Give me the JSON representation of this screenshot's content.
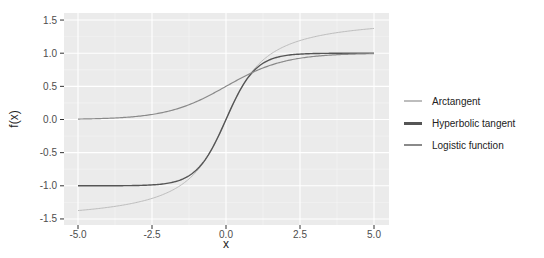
{
  "chart_data": {
    "type": "line",
    "title": "",
    "xlabel": "x",
    "ylabel": "f(x)",
    "xlim": [
      -5.5,
      5.5
    ],
    "ylim": [
      -1.5,
      1.5
    ],
    "x_ticks": [
      -5.0,
      -2.5,
      0.0,
      2.5,
      5.0
    ],
    "x_tick_labels": [
      "-5.0",
      "-2.5",
      "0.0",
      "2.5",
      "5.0"
    ],
    "y_ticks": [
      -1.5,
      -1.0,
      -0.5,
      0.0,
      0.5,
      1.0,
      1.5
    ],
    "y_tick_labels": [
      "-1.5",
      "-1.0",
      "-0.5",
      "0.0",
      "0.5",
      "1.0",
      "1.5"
    ],
    "grid": true,
    "legend_position": "right",
    "x": [
      -5,
      -4,
      -3,
      -2,
      -1,
      0,
      1,
      2,
      3,
      4,
      5
    ],
    "series": [
      {
        "name": "Arctangent",
        "color": "#bdbdbd",
        "function": "atan(x)",
        "values": [
          -1.37,
          -1.33,
          -1.25,
          -1.11,
          -0.79,
          0.0,
          0.79,
          1.11,
          1.25,
          1.33,
          1.37
        ]
      },
      {
        "name": "Hyperbolic tangent",
        "color": "#555555",
        "function": "tanh(x)",
        "values": [
          -1.0,
          -1.0,
          -1.0,
          -0.96,
          -0.76,
          0.0,
          0.76,
          0.96,
          1.0,
          1.0,
          1.0
        ]
      },
      {
        "name": "Logistic function",
        "color": "#8a8a8a",
        "function": "1/(1+exp(-x))",
        "values": [
          0.01,
          0.02,
          0.05,
          0.12,
          0.27,
          0.5,
          0.73,
          0.88,
          0.95,
          0.98,
          0.99
        ]
      }
    ]
  },
  "legend": {
    "items": [
      {
        "label": "Arctangent",
        "color": "#bdbdbd"
      },
      {
        "label": "Hyperbolic tangent",
        "color": "#555555"
      },
      {
        "label": "Logistic function",
        "color": "#8a8a8a"
      }
    ]
  },
  "axes": {
    "x_title": "x",
    "y_title": "f(x)"
  }
}
